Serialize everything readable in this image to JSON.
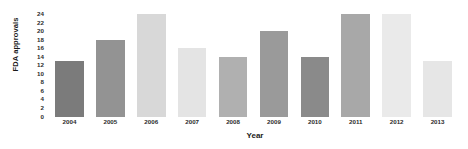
{
  "chart_data": {
    "type": "bar",
    "title": "",
    "xlabel": "Year",
    "ylabel": "FDA approvals",
    "categories": [
      "2004",
      "2005",
      "2006",
      "2007",
      "2008",
      "2009",
      "2010",
      "2011",
      "2012",
      "2013"
    ],
    "values": [
      13,
      18,
      24,
      16,
      14,
      20,
      14,
      24,
      24,
      13
    ],
    "ylim": [
      0,
      24
    ],
    "yticks": [
      0,
      2,
      4,
      6,
      8,
      10,
      12,
      14,
      16,
      18,
      20,
      22,
      24
    ],
    "ytick_labels": [
      "0",
      "2",
      "4",
      "6",
      "8",
      "10",
      "12",
      "14",
      "16",
      "18",
      "20",
      "22",
      "24"
    ],
    "grid": false,
    "legend": null,
    "bar_colors": [
      "#7b7b7b",
      "#939393",
      "#d8d8d8",
      "#e4e4e4",
      "#b0b0b0",
      "#9a9a9a",
      "#8a8a8a",
      "#a8a8a8",
      "#eaeaea",
      "#e6e6e6"
    ]
  }
}
